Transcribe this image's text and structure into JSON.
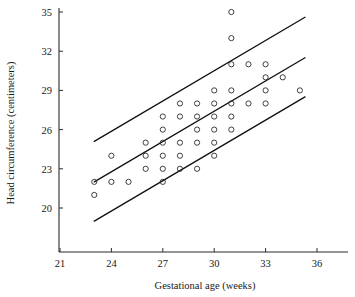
{
  "chart_data": {
    "type": "scatter",
    "title": "",
    "xlabel": "Gestational age (weeks)",
    "ylabel": "Head circumference (centimeters)",
    "xlim": [
      20.2,
      36.9
    ],
    "ylim": [
      18.6,
      35.6
    ],
    "xticks": [
      21,
      24,
      27,
      30,
      33,
      36
    ],
    "yticks": [
      20,
      23,
      26,
      29,
      32,
      35
    ],
    "grid": false,
    "legend": "none",
    "marker": "open-circle",
    "points": [
      {
        "x": 23.0,
        "y": 22.0
      },
      {
        "x": 23.0,
        "y": 21.0
      },
      {
        "x": 24.0,
        "y": 24.0
      },
      {
        "x": 24.0,
        "y": 22.0
      },
      {
        "x": 25.0,
        "y": 22.0
      },
      {
        "x": 26.0,
        "y": 25.0
      },
      {
        "x": 26.0,
        "y": 24.0
      },
      {
        "x": 26.0,
        "y": 23.0
      },
      {
        "x": 27.0,
        "y": 27.0
      },
      {
        "x": 27.0,
        "y": 26.0
      },
      {
        "x": 27.0,
        "y": 25.0
      },
      {
        "x": 27.0,
        "y": 24.0
      },
      {
        "x": 27.0,
        "y": 23.0
      },
      {
        "x": 27.0,
        "y": 22.0
      },
      {
        "x": 28.0,
        "y": 28.0
      },
      {
        "x": 28.0,
        "y": 27.0
      },
      {
        "x": 28.0,
        "y": 25.0
      },
      {
        "x": 28.0,
        "y": 24.0
      },
      {
        "x": 28.0,
        "y": 23.0
      },
      {
        "x": 29.0,
        "y": 28.0
      },
      {
        "x": 29.0,
        "y": 27.0
      },
      {
        "x": 29.0,
        "y": 26.0
      },
      {
        "x": 29.0,
        "y": 25.0
      },
      {
        "x": 29.0,
        "y": 23.0
      },
      {
        "x": 30.0,
        "y": 29.0
      },
      {
        "x": 30.0,
        "y": 28.0
      },
      {
        "x": 30.0,
        "y": 27.0
      },
      {
        "x": 30.0,
        "y": 26.0
      },
      {
        "x": 30.0,
        "y": 25.0
      },
      {
        "x": 30.0,
        "y": 24.0
      },
      {
        "x": 31.0,
        "y": 35.0
      },
      {
        "x": 31.0,
        "y": 33.0
      },
      {
        "x": 31.0,
        "y": 31.0
      },
      {
        "x": 31.0,
        "y": 29.0
      },
      {
        "x": 31.0,
        "y": 28.0
      },
      {
        "x": 31.0,
        "y": 27.0
      },
      {
        "x": 31.0,
        "y": 26.0
      },
      {
        "x": 32.0,
        "y": 31.0
      },
      {
        "x": 32.0,
        "y": 28.0
      },
      {
        "x": 33.0,
        "y": 31.0
      },
      {
        "x": 33.0,
        "y": 30.0
      },
      {
        "x": 33.0,
        "y": 29.0
      },
      {
        "x": 33.0,
        "y": 28.0
      },
      {
        "x": 34.0,
        "y": 30.0
      },
      {
        "x": 35.0,
        "y": 29.0
      }
    ],
    "lines": [
      {
        "name": "upper-band-line",
        "x1": 23.0,
        "y1": 25.1,
        "x2": 35.3,
        "y2": 34.6
      },
      {
        "name": "fit-line",
        "x1": 23.0,
        "y1": 22.0,
        "x2": 35.3,
        "y2": 31.5
      },
      {
        "name": "lower-band-line",
        "x1": 23.0,
        "y1": 19.0,
        "x2": 35.3,
        "y2": 28.5
      }
    ]
  }
}
